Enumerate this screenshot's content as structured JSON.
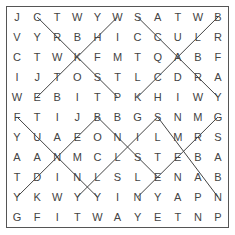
{
  "puzzle": {
    "rows": [
      "JCTWYWSATWB",
      "VYRBHICCULR",
      "CTWKFMTQABF",
      "IJTOSTLCDRA",
      "WEBITPKHIWY",
      "FTIJBBGSNMG",
      "YUAEONILMRS",
      "AANMCLSTEBA",
      "TDINLSLENAB",
      "YKWYYINYAPN",
      "GFITWAYETNP"
    ],
    "found_lines": [
      {
        "from": [
          0,
          1
        ],
        "to": [
          4,
          5
        ]
      },
      {
        "from": [
          0,
          5
        ],
        "to": [
          4,
          1
        ]
      },
      {
        "from": [
          0,
          6
        ],
        "to": [
          4,
          10
        ]
      },
      {
        "from": [
          0,
          10
        ],
        "to": [
          4,
          6
        ]
      },
      {
        "from": [
          5,
          0
        ],
        "to": [
          9,
          4
        ]
      },
      {
        "from": [
          5,
          4
        ],
        "to": [
          9,
          0
        ]
      },
      {
        "from": [
          5,
          4
        ],
        "to": [
          8,
          7
        ]
      },
      {
        "from": [
          5,
          7
        ],
        "to": [
          9,
          3
        ]
      },
      {
        "from": [
          5,
          7
        ],
        "to": [
          9,
          10
        ]
      },
      {
        "from": [
          5,
          10
        ],
        "to": [
          9,
          6
        ]
      }
    ],
    "line_color": "#444444"
  }
}
